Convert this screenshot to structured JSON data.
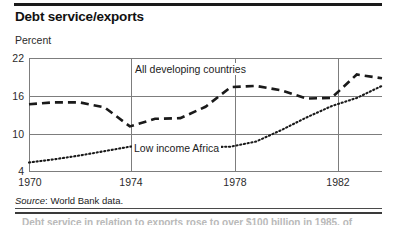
{
  "header": {
    "title": "Debt service/exports"
  },
  "axis": {
    "unit_label": "Percent",
    "y_ticks": [
      22,
      16,
      10,
      4
    ],
    "x_ticks": [
      1970,
      1974,
      1978,
      1982
    ]
  },
  "labels": {
    "series_developing": "All developing countries",
    "series_africa": "Low income Africa"
  },
  "footer": {
    "source_prefix": "Source",
    "source_text": ": World Bank data.",
    "clipped_line": "Debt service in relation to exports rose to over $100 billion in 1985, of"
  },
  "colors": {
    "ink": "#000000",
    "grid": "#7d7d7d",
    "line": "#1a1a1a"
  },
  "chart_data": {
    "type": "line",
    "title": "Debt service/exports",
    "xlabel": "",
    "ylabel": "Percent",
    "ylim": [
      4,
      22
    ],
    "xlim": [
      1970,
      1984
    ],
    "yticks": [
      4,
      10,
      16,
      22
    ],
    "xticks": [
      1970,
      1974,
      1978,
      1982
    ],
    "grid": true,
    "legend": "inline-annotations",
    "x": [
      1970,
      1971,
      1972,
      1973,
      1974,
      1975,
      1976,
      1977,
      1978,
      1979,
      1980,
      1981,
      1982,
      1983,
      1984
    ],
    "series": [
      {
        "name": "All developing countries",
        "style": "dashed",
        "values": [
          14.7,
          15.0,
          15.0,
          14.2,
          11.2,
          12.4,
          12.5,
          14.3,
          17.4,
          17.6,
          16.9,
          15.6,
          15.7,
          19.4,
          18.8
        ]
      },
      {
        "name": "Low income Africa",
        "style": "dotted",
        "values": [
          5.5,
          6.0,
          6.6,
          7.3,
          8.0,
          8.3,
          7.9,
          7.9,
          8.0,
          8.8,
          10.6,
          12.6,
          14.4,
          15.7,
          17.6
        ]
      }
    ]
  }
}
